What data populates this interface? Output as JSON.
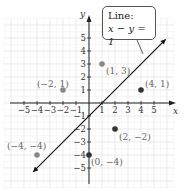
{
  "chart_data": {
    "type": "scatter",
    "title": "",
    "xlabel": "x",
    "ylabel": "y",
    "xlim": [
      -5.5,
      5.5
    ],
    "ylim": [
      -5.5,
      5.5
    ],
    "grid": true,
    "x_ticks": [
      "−5",
      "−4",
      "−3",
      "−2",
      "−1",
      "1",
      "2",
      "3",
      "4",
      "5"
    ],
    "y_ticks": [
      "5",
      "4",
      "3",
      "2",
      "1",
      "−1",
      "−2",
      "−3",
      "−4",
      "−5"
    ],
    "line": {
      "equation": "x − y = 1",
      "slope": 1,
      "intercept": -1,
      "label": "Line:"
    },
    "points": [
      {
        "x": -2,
        "y": 1,
        "label": "(−2, 1)",
        "on_line": false,
        "color": "#888888"
      },
      {
        "x": 1,
        "y": 3,
        "label": "(1, 3)",
        "on_line": false,
        "color": "#888888"
      },
      {
        "x": 4,
        "y": 1,
        "label": "(4, 1)",
        "on_line": false,
        "color": "#333333"
      },
      {
        "x": 2,
        "y": -2,
        "label": "(2, −2)",
        "on_line": false,
        "color": "#333333"
      },
      {
        "x": -4,
        "y": -4,
        "label": "(−4, −4)",
        "on_line": false,
        "color": "#888888"
      },
      {
        "x": 0,
        "y": -4,
        "label": "(0, −4)",
        "on_line": false,
        "color": "#333333"
      }
    ]
  },
  "callout": {
    "title": "Line:",
    "equation": "x − y = 1"
  },
  "axes": {
    "x_label": "x",
    "y_label": "y"
  }
}
